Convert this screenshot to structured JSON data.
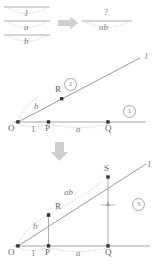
{
  "figure": {
    "type": "geometric-construction-diagram",
    "colors": {
      "line": "#8c8c8c",
      "dashed": "#b5b5b5",
      "point": "#3d3d3d",
      "text": "#6b6b6b",
      "arrow": "#c9c9c9",
      "rule": "#9e9e9e"
    }
  },
  "panel_top": {
    "name": "ratio-stack",
    "left_stack": {
      "items": [
        {
          "id": "num-1",
          "text": "1"
        },
        {
          "id": "num-a",
          "text": "a"
        },
        {
          "id": "num-b",
          "text": "b"
        }
      ]
    },
    "arrow": {
      "id": "transform-arrow",
      "glyph": "➡",
      "direction": "right"
    },
    "right_stack": {
      "items": [
        {
          "id": "num-q",
          "text": "?"
        },
        {
          "id": "num-ab",
          "text": "ab"
        }
      ]
    }
  },
  "panel_middle": {
    "name": "construction-step-2",
    "line_label": "l",
    "badges": [
      {
        "id": "badge-1",
        "text": "1"
      },
      {
        "id": "badge-2",
        "text": "2"
      }
    ],
    "points": [
      {
        "id": "point-O",
        "label": "O"
      },
      {
        "id": "point-P",
        "label": "P"
      },
      {
        "id": "point-Q",
        "label": "Q"
      },
      {
        "id": "point-R",
        "label": "R"
      }
    ],
    "segments": [
      {
        "id": "seg-OP",
        "label": "1"
      },
      {
        "id": "seg-PQ",
        "label": "a"
      },
      {
        "id": "seg-OR",
        "label": "b"
      }
    ]
  },
  "panel_arrow": {
    "name": "down-arrow",
    "glyph": "⬇",
    "direction": "down"
  },
  "panel_bottom": {
    "name": "construction-step-3",
    "line_label": "l",
    "badges": [
      {
        "id": "badge-3",
        "text": "3"
      }
    ],
    "points": [
      {
        "id": "point-O",
        "label": "O"
      },
      {
        "id": "point-P",
        "label": "P"
      },
      {
        "id": "point-Q",
        "label": "Q"
      },
      {
        "id": "point-R",
        "label": "R"
      },
      {
        "id": "point-S",
        "label": "S"
      }
    ],
    "segments": [
      {
        "id": "seg-OP",
        "label": "1"
      },
      {
        "id": "seg-PQ",
        "label": "a"
      },
      {
        "id": "seg-OR",
        "label": "b"
      },
      {
        "id": "seg-RS",
        "label": "ab"
      }
    ]
  }
}
